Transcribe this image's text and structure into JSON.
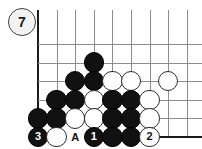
{
  "diagram": {
    "kind": "go-board-problem-diagram",
    "figure_number": "7",
    "board": {
      "left_edge_x": 38,
      "bottom_edge_y": 137,
      "cell": 18.6,
      "columns": 9,
      "rows": 7,
      "line_color": "#8d8d8d",
      "edge_color": "#1a1a1a",
      "background": "#ffffff"
    },
    "stone_radius": 10.2,
    "colors": {
      "black_stone": "#111111",
      "white_stone": "#ffffff",
      "white_stone_border": "#2b2b2b",
      "black_label_text": "#ffffff",
      "white_label_text": "#111111"
    },
    "stones": [
      {
        "name": "black-stone-r1c3",
        "color": "black",
        "col": 3,
        "row": 1,
        "label": ""
      },
      {
        "name": "black-stone-r2c2",
        "color": "black",
        "col": 2,
        "row": 2,
        "label": ""
      },
      {
        "name": "black-stone-r2c3",
        "color": "black",
        "col": 3,
        "row": 2,
        "label": ""
      },
      {
        "name": "white-stone-r2c4",
        "color": "white",
        "col": 4,
        "row": 2,
        "label": ""
      },
      {
        "name": "white-stone-r2c5",
        "color": "white",
        "col": 5,
        "row": 2,
        "label": ""
      },
      {
        "name": "white-stone-r2c7",
        "color": "white",
        "col": 7,
        "row": 2,
        "label": ""
      },
      {
        "name": "black-stone-r3c1",
        "color": "black",
        "col": 1,
        "row": 3,
        "label": ""
      },
      {
        "name": "black-stone-r3c2",
        "color": "black",
        "col": 2,
        "row": 3,
        "label": ""
      },
      {
        "name": "white-stone-r3c3",
        "color": "white",
        "col": 3,
        "row": 3,
        "label": ""
      },
      {
        "name": "black-stone-r3c4",
        "color": "black",
        "col": 4,
        "row": 3,
        "label": ""
      },
      {
        "name": "black-stone-r3c5",
        "color": "black",
        "col": 5,
        "row": 3,
        "label": ""
      },
      {
        "name": "white-stone-r3c6",
        "color": "white",
        "col": 6,
        "row": 3,
        "label": ""
      },
      {
        "name": "black-stone-r4c0",
        "color": "black",
        "col": 0,
        "row": 4,
        "label": ""
      },
      {
        "name": "black-stone-r4c1",
        "color": "black",
        "col": 1,
        "row": 4,
        "label": ""
      },
      {
        "name": "white-stone-r4c2",
        "color": "white",
        "col": 2,
        "row": 4,
        "label": ""
      },
      {
        "name": "white-stone-r4c3",
        "color": "white",
        "col": 3,
        "row": 4,
        "label": ""
      },
      {
        "name": "black-stone-r4c4",
        "color": "black",
        "col": 4,
        "row": 4,
        "label": ""
      },
      {
        "name": "black-stone-r4c5",
        "color": "black",
        "col": 5,
        "row": 4,
        "label": ""
      },
      {
        "name": "white-stone-r4c6",
        "color": "white",
        "col": 6,
        "row": 4,
        "label": ""
      },
      {
        "name": "black-stone-move-3",
        "color": "black",
        "col": 0,
        "row": 5,
        "label": "3"
      },
      {
        "name": "white-stone-r5c1",
        "color": "white",
        "col": 1,
        "row": 5,
        "label": ""
      },
      {
        "name": "black-stone-move-1",
        "color": "black",
        "col": 3,
        "row": 5,
        "label": "1"
      },
      {
        "name": "black-stone-r5c4",
        "color": "black",
        "col": 4,
        "row": 5,
        "label": ""
      },
      {
        "name": "black-stone-r5c5",
        "color": "black",
        "col": 5,
        "row": 5,
        "label": ""
      },
      {
        "name": "white-stone-move-2",
        "color": "white",
        "col": 6,
        "row": 5,
        "label": "2"
      }
    ],
    "point_markers": [
      {
        "name": "point-marker-A",
        "label": "A",
        "col": 2,
        "row": 5
      }
    ]
  }
}
